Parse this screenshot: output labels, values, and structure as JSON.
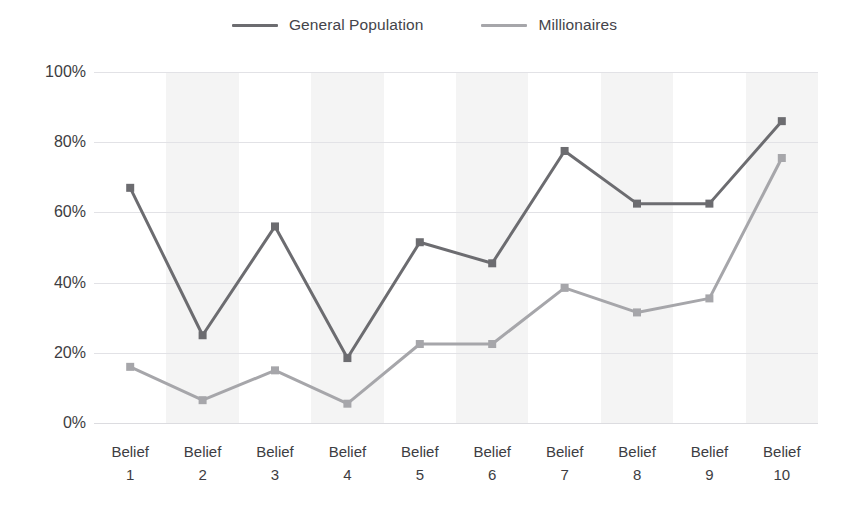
{
  "chart_data": {
    "type": "line",
    "title": "",
    "xlabel": "",
    "ylabel": "",
    "ylim": [
      0,
      100
    ],
    "grid": true,
    "legend_position": "top-center",
    "categories": [
      "Belief 1",
      "Belief 2",
      "Belief 3",
      "Belief 4",
      "Belief 5",
      "Belief 6",
      "Belief 7",
      "Belief 8",
      "Belief 9",
      "Belief 10"
    ],
    "category_lines": [
      [
        "Belief",
        "1"
      ],
      [
        "Belief",
        "2"
      ],
      [
        "Belief",
        "3"
      ],
      [
        "Belief",
        "4"
      ],
      [
        "Belief",
        "5"
      ],
      [
        "Belief",
        "6"
      ],
      [
        "Belief",
        "7"
      ],
      [
        "Belief",
        "8"
      ],
      [
        "Belief",
        "9"
      ],
      [
        "Belief",
        "10"
      ]
    ],
    "y_ticks": [
      0,
      20,
      40,
      60,
      80,
      100
    ],
    "y_tick_labels": [
      "0%",
      "20%",
      "40%",
      "60%",
      "80%",
      "100%"
    ],
    "series": [
      {
        "name": "General Population",
        "color": "#6c6c70",
        "values": [
          67,
          25,
          56,
          18.5,
          51.5,
          45.5,
          77.5,
          62.5,
          62.5,
          86
        ]
      },
      {
        "name": "Millionaires",
        "color": "#a6a6aa",
        "values": [
          16,
          6.5,
          15,
          5.5,
          22.5,
          22.5,
          38.5,
          31.5,
          35.5,
          75.5
        ]
      }
    ],
    "band_color": "#f4f4f4",
    "banded_categories": [
      2,
      4,
      6,
      8,
      10
    ]
  }
}
